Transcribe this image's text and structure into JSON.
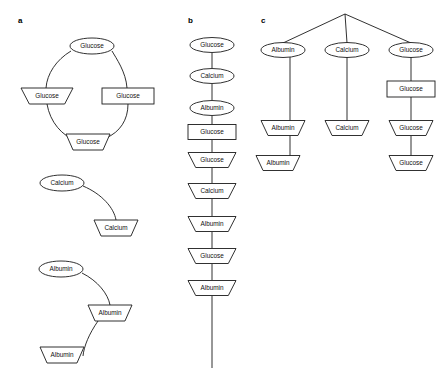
{
  "figure": {
    "background_color": "#ffffff",
    "stroke_color": "#1a1a1a",
    "text_color": "#111111",
    "panels": [
      {
        "id": "a",
        "label": "a",
        "label_x": 18,
        "label_y": 21,
        "groups": [
          {
            "id": "a-cycle-glucose",
            "name": "glucose-cycle",
            "nodes": [
              {
                "id": "a1",
                "label": "Glucose",
                "shape": "ellipse",
                "cx": 92,
                "cy": 46,
                "w": 44,
                "h": 16
              },
              {
                "id": "a2",
                "label": "Glucose",
                "shape": "trapezoid-down",
                "cx": 47,
                "cy": 96,
                "w": 52,
                "h": 16
              },
              {
                "id": "a3",
                "label": "Glucose",
                "shape": "rectangle",
                "cx": 128,
                "cy": 96,
                "w": 52,
                "h": 16
              },
              {
                "id": "a4",
                "label": "Glucose",
                "shape": "trapezoid-down",
                "cx": 88,
                "cy": 142,
                "w": 44,
                "h": 16
              }
            ],
            "edges": [
              {
                "from": "a1",
                "to": "a2",
                "path": "M 71,51 C 56,60 47,74 46,88"
              },
              {
                "from": "a2",
                "to": "a4",
                "path": "M 47,104 C 50,122 62,136 77,141"
              },
              {
                "from": "a4",
                "to": "a3",
                "path": "M 106,138 C 120,132 128,120 128,104"
              },
              {
                "from": "a3",
                "to": "a1",
                "path": "M 127,88 C 126,72 116,58 112,51"
              }
            ]
          },
          {
            "id": "a-chain-calcium",
            "name": "calcium-chain",
            "nodes": [
              {
                "id": "b1",
                "label": "Calcium",
                "shape": "ellipse",
                "cx": 62,
                "cy": 183,
                "w": 44,
                "h": 16
              },
              {
                "id": "b2",
                "label": "Calcium",
                "shape": "trapezoid-down",
                "cx": 116,
                "cy": 228,
                "w": 44,
                "h": 16
              }
            ],
            "edges": [
              {
                "from": "b1",
                "to": "b2",
                "path": "M 83,186 C 102,194 114,208 116,220"
              }
            ]
          },
          {
            "id": "a-chain-albumin",
            "name": "albumin-chain",
            "nodes": [
              {
                "id": "c1",
                "label": "Albumin",
                "shape": "ellipse",
                "cx": 61,
                "cy": 269,
                "w": 44,
                "h": 16
              },
              {
                "id": "c2",
                "label": "Albumin",
                "shape": "trapezoid-down",
                "cx": 110,
                "cy": 313,
                "w": 44,
                "h": 16
              },
              {
                "id": "c3",
                "label": "Albumin",
                "shape": "trapezoid-down",
                "cx": 62,
                "cy": 355,
                "w": 44,
                "h": 16
              }
            ],
            "edges": [
              {
                "from": "c1",
                "to": "c2",
                "path": "M 82,273 C 98,281 108,294 110,305"
              },
              {
                "from": "c2",
                "to": "c3",
                "path": "M 98,321 C 89,334 84,346 83,356"
              }
            ]
          }
        ]
      },
      {
        "id": "b",
        "label": "b",
        "label_x": 188,
        "label_y": 21,
        "groups": [
          {
            "id": "b-chain",
            "name": "vertical-chain",
            "nodes": [
              {
                "id": "v1",
                "label": "Glucose",
                "shape": "ellipse",
                "cx": 212,
                "cy": 45,
                "w": 44,
                "h": 15
              },
              {
                "id": "v2",
                "label": "Calcium",
                "shape": "ellipse",
                "cx": 212,
                "cy": 76,
                "w": 44,
                "h": 15
              },
              {
                "id": "v3",
                "label": "Albumin",
                "shape": "ellipse",
                "cx": 212,
                "cy": 108,
                "w": 44,
                "h": 15
              },
              {
                "id": "v4",
                "label": "Glucose",
                "shape": "rectangle",
                "cx": 212,
                "cy": 132,
                "w": 48,
                "h": 15
              },
              {
                "id": "v5",
                "label": "Glucose",
                "shape": "trapezoid-down",
                "cx": 212,
                "cy": 160,
                "w": 48,
                "h": 15
              },
              {
                "id": "v6",
                "label": "Calcium",
                "shape": "trapezoid-down",
                "cx": 212,
                "cy": 191,
                "w": 48,
                "h": 15
              },
              {
                "id": "v7",
                "label": "Albumin",
                "shape": "trapezoid-down",
                "cx": 212,
                "cy": 224,
                "w": 48,
                "h": 15
              },
              {
                "id": "v8",
                "label": "Glucose",
                "shape": "trapezoid-down",
                "cx": 212,
                "cy": 256,
                "w": 48,
                "h": 15
              },
              {
                "id": "v9",
                "label": "Albumin",
                "shape": "trapezoid-down",
                "cx": 212,
                "cy": 288,
                "w": 48,
                "h": 15
              }
            ],
            "edges": [
              {
                "from": "v1",
                "to": "v2",
                "path": "M 212,53 L 212,68"
              },
              {
                "from": "v2",
                "to": "v3",
                "path": "M 212,84 L 212,100"
              },
              {
                "from": "v3",
                "to": "v4",
                "path": "M 212,116 L 212,124"
              },
              {
                "from": "v4",
                "to": "v5",
                "path": "M 212,140 L 212,152"
              },
              {
                "from": "v5",
                "to": "v6",
                "path": "M 212,168 L 212,183"
              },
              {
                "from": "v6",
                "to": "v7",
                "path": "M 212,199 L 212,216"
              },
              {
                "from": "v7",
                "to": "v8",
                "path": "M 212,232 L 212,248"
              },
              {
                "from": "v8",
                "to": "v9",
                "path": "M 212,264 L 212,280"
              },
              {
                "from": "v9",
                "to": "tail",
                "path": "M 212,296 L 212,368"
              }
            ]
          }
        ]
      },
      {
        "id": "c",
        "label": "c",
        "label_x": 261,
        "label_y": 21,
        "groups": [
          {
            "id": "c-tree",
            "name": "branching-tree",
            "root": {
              "x": 345,
              "y": 14
            },
            "nodes": [
              {
                "id": "t1",
                "label": "Albumin",
                "shape": "ellipse",
                "cx": 283,
                "cy": 50,
                "w": 44,
                "h": 15
              },
              {
                "id": "t2",
                "label": "Calcium",
                "shape": "ellipse",
                "cx": 347,
                "cy": 50,
                "w": 44,
                "h": 15
              },
              {
                "id": "t3",
                "label": "Glucose",
                "shape": "ellipse",
                "cx": 411,
                "cy": 50,
                "w": 44,
                "h": 15
              },
              {
                "id": "t4",
                "label": "Glucose",
                "shape": "rectangle",
                "cx": 411,
                "cy": 89,
                "w": 48,
                "h": 16
              },
              {
                "id": "t5",
                "label": "Albumin",
                "shape": "trapezoid-down",
                "cx": 283,
                "cy": 128,
                "w": 44,
                "h": 15
              },
              {
                "id": "t6",
                "label": "Calcium",
                "shape": "trapezoid-down",
                "cx": 347,
                "cy": 128,
                "w": 44,
                "h": 15
              },
              {
                "id": "t7",
                "label": "Glucose",
                "shape": "trapezoid-down",
                "cx": 411,
                "cy": 128,
                "w": 44,
                "h": 15
              },
              {
                "id": "t8",
                "label": "Albumin",
                "shape": "trapezoid-down",
                "cx": 278,
                "cy": 163,
                "w": 44,
                "h": 15
              },
              {
                "id": "t9",
                "label": "Glucose",
                "shape": "trapezoid-down",
                "cx": 411,
                "cy": 163,
                "w": 44,
                "h": 15
              }
            ],
            "edges": [
              {
                "from": "root",
                "to": "t1",
                "path": "M 345,14 L 283,43"
              },
              {
                "from": "root",
                "to": "t2",
                "path": "M 345,14 L 347,43"
              },
              {
                "from": "root",
                "to": "t3",
                "path": "M 345,14 L 411,43"
              },
              {
                "from": "t1",
                "to": "t5",
                "path": "M 290,57 L 290,121"
              },
              {
                "from": "t2",
                "to": "t6",
                "path": "M 347,57 L 347,121"
              },
              {
                "from": "t3",
                "to": "t4",
                "path": "M 411,57 L 411,81"
              },
              {
                "from": "t4",
                "to": "t7",
                "path": "M 411,97 L 411,121"
              },
              {
                "from": "t5",
                "to": "t8",
                "path": "M 290,136 L 290,156"
              },
              {
                "from": "t7",
                "to": "t9",
                "path": "M 411,136 L 411,156"
              }
            ]
          }
        ]
      }
    ]
  }
}
